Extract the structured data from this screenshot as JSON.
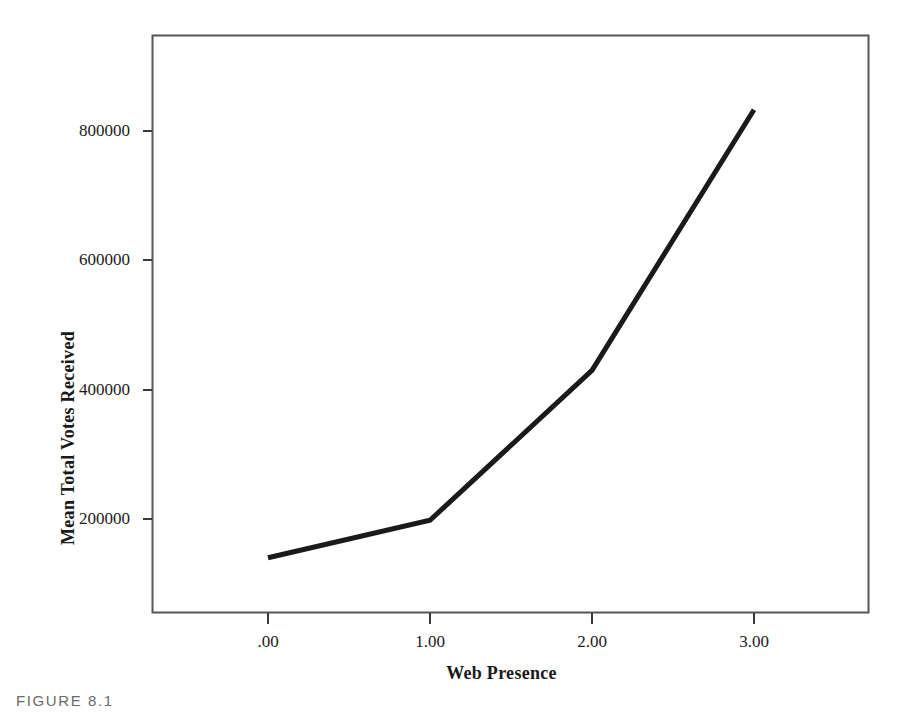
{
  "figure": {
    "caption": "FIGURE 8.1"
  },
  "chart_data": {
    "type": "line",
    "title": "",
    "subtitle": "",
    "xlabel": "Web Presence",
    "ylabel": "Mean Total Votes Received",
    "x": [
      0,
      1,
      2,
      3
    ],
    "xtick_labels": [
      ".00",
      "1.00",
      "2.00",
      "3.00"
    ],
    "ytick_labels": [
      "200000",
      "400000",
      "600000",
      "800000"
    ],
    "ytick_values": [
      200000,
      400000,
      600000,
      800000
    ],
    "values": [
      140000,
      198000,
      430000,
      833000
    ],
    "series": [
      {
        "name": "Mean Total Votes Received",
        "values": [
          140000,
          198000,
          430000,
          833000
        ]
      }
    ],
    "xlim": [
      -0.72,
      3.72
    ],
    "ylim": [
      20000,
      950000
    ],
    "grid": false,
    "legend": false,
    "legend_position": "none",
    "line_color": "#1a1a1a",
    "line_width": 5,
    "frame_color": "#55555a",
    "background": "#ffffff",
    "annotations": []
  }
}
